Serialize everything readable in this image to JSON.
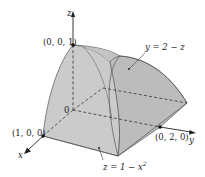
{
  "figure": {
    "colors": {
      "surface": "#c9c9c9",
      "surface_dark": "#b8b8b8",
      "edge": "#555555",
      "axis": "#222222",
      "background": "#ffffff"
    },
    "axes": {
      "x_label": "x",
      "y_label": "y",
      "z_label": "z",
      "origin_label": "0"
    },
    "points": [
      {
        "id": "z-intercept",
        "label": "(0, 0, 1)"
      },
      {
        "id": "x-intercept",
        "label": "(1, 0, 0)"
      },
      {
        "id": "y-intercept",
        "label": "(0, 2, 0)"
      }
    ],
    "surface_labels": {
      "plane": "y = 2 − z",
      "cylinder_prefix": "z = 1 − x",
      "cylinder_exp": "2"
    }
  }
}
